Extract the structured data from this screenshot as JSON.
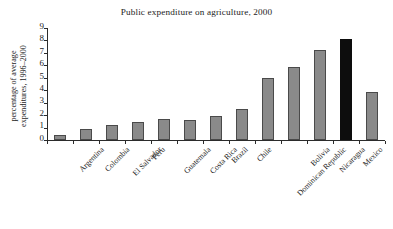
{
  "chart_data": {
    "type": "bar",
    "title": "Public expenditure on agriculture, 2000",
    "xlabel": "",
    "ylabel_lines": [
      "percentage of average",
      "expenditures, 1996–2000"
    ],
    "ylabel": "percentage of average expenditures, 1996–2000",
    "ylim": [
      0,
      9
    ],
    "yticks": [
      0,
      1,
      2,
      3,
      4,
      5,
      6,
      7,
      8,
      9
    ],
    "grid": false,
    "legend": "none",
    "bar_color": "#8a8a8a",
    "highlight_color": "#0d0d0d",
    "highlight_category": "Mexico",
    "categories": [
      "Argentina",
      "Colombia",
      "El Salvador",
      "Peru",
      "Guatemala",
      "Costa Rica",
      "Brazil",
      "Chile",
      "Dominican Republic",
      "Bolivia",
      "Nicaragua",
      "Mexico",
      "Latin America and the Caribbean"
    ],
    "category_label_lines": [
      [
        "Argentina"
      ],
      [
        "Colombia"
      ],
      [
        "El Salvador"
      ],
      [
        "Peru"
      ],
      [
        "Guatemala"
      ],
      [
        "Costa Rica"
      ],
      [
        "Brazil"
      ],
      [
        "Chile"
      ],
      [
        "Dominican Republic"
      ],
      [
        "Bolivia"
      ],
      [
        "Nicaragua"
      ],
      [
        "Mexico"
      ],
      [
        "Latin America and",
        "the Caribbean"
      ]
    ],
    "values": [
      0.4,
      0.9,
      1.2,
      1.45,
      1.7,
      1.6,
      1.9,
      2.5,
      5.0,
      5.9,
      7.2,
      8.1,
      3.85
    ]
  }
}
